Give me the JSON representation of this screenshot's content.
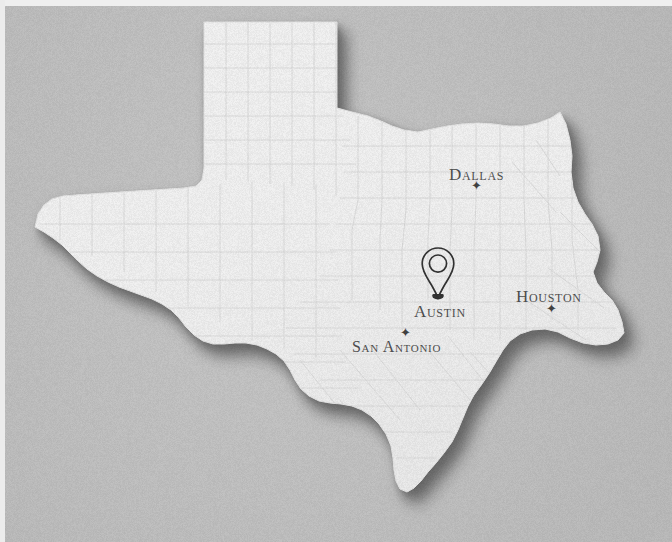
{
  "image": {
    "kind": "photographed-map",
    "subject": "Texas state map with county outlines",
    "background_color": "#c6c6c6",
    "landmass_color": "#ffffff",
    "county_line_color": "#e4e4e4",
    "shadow_color": "#8a8a8a",
    "label_color": "#4a4a4a"
  },
  "map": {
    "state_name": "Texas",
    "marker": {
      "name": "austin-location-pin",
      "icon": "map-pin-icon",
      "color": "#2b2b2b",
      "x": 438,
      "y": 300
    },
    "cities": [
      {
        "id": "dallas",
        "label": "Dallas",
        "star": "✦",
        "star_position": "below"
      },
      {
        "id": "houston",
        "label": "Houston",
        "star": "✦",
        "star_position": "below"
      },
      {
        "id": "san-antonio",
        "label": "San Antonio",
        "star": "✦",
        "star_position": "above"
      },
      {
        "id": "austin",
        "label": "Austin",
        "star": "",
        "star_position": "pin"
      }
    ]
  }
}
